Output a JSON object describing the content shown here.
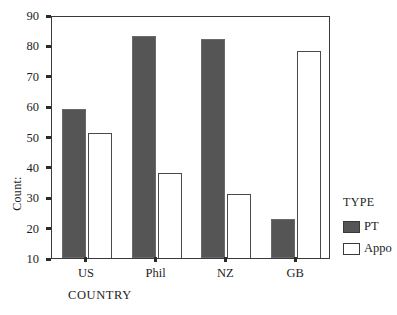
{
  "chart_data": {
    "type": "bar",
    "title": "",
    "subtitle": "",
    "xlabel": "COUNTRY",
    "ylabel": "Count:",
    "categories": [
      "US",
      "Phil",
      "NZ",
      "GB"
    ],
    "series": [
      {
        "name": "PT",
        "values": [
          59,
          83,
          82,
          23
        ],
        "color": "#555555"
      },
      {
        "name": "Appo",
        "values": [
          51,
          38,
          31,
          78
        ],
        "color": "#ffffff"
      }
    ],
    "ylim": [
      10,
      90
    ],
    "yticks": [
      10,
      20,
      30,
      40,
      50,
      60,
      70,
      80,
      90
    ],
    "ytick_labels": [
      "10",
      "20",
      "30",
      "40",
      "50",
      "60",
      "70",
      "80",
      "90"
    ],
    "grid": false,
    "legend": {
      "title": "TYPE",
      "position": "right",
      "entries": [
        "PT",
        "Appo"
      ]
    }
  },
  "legend": {
    "title": "TYPE",
    "entries": [
      {
        "label": "PT",
        "swatch": "pt"
      },
      {
        "label": "Appo",
        "swatch": "appo"
      }
    ]
  }
}
